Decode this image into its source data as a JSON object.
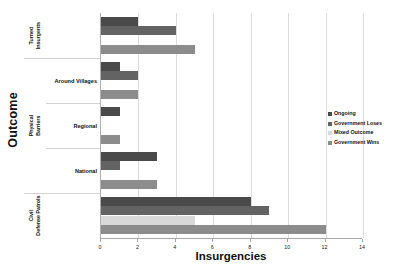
{
  "chart_data": {
    "type": "bar",
    "orientation": "horizontal",
    "title": "",
    "xlabel": "Insurgencies",
    "ylabel": "Outcome",
    "xlim": [
      0,
      14
    ],
    "xticks": [
      0,
      2,
      4,
      6,
      8,
      10,
      12,
      14
    ],
    "grid": "vertical",
    "legend_position": "right",
    "categories": [
      "Turned Insurgents",
      "Around Villages",
      "Regional",
      "National",
      "Civil Defense Patrols"
    ],
    "category_groups": [
      {
        "label": "Turned Insurgents",
        "members": [
          "Turned Insurgents"
        ]
      },
      {
        "label": "Physical Barriers",
        "members": [
          "Around Villages",
          "Regional",
          "National"
        ]
      },
      {
        "label": "Civil Defense Patrols",
        "members": [
          "Civil Defense Patrols"
        ]
      }
    ],
    "series": [
      {
        "name": "Ongoing",
        "color": "#4a4a4a",
        "values": [
          2,
          1,
          1,
          3,
          8
        ]
      },
      {
        "name": "Government Loses",
        "color": "#636363",
        "values": [
          4,
          2,
          0,
          1,
          9
        ]
      },
      {
        "name": "Mixed Outcome",
        "color": "#d9d9d9",
        "values": [
          0,
          0,
          0,
          0,
          5
        ]
      },
      {
        "name": "Government Wins",
        "color": "#8c8c8c",
        "values": [
          5,
          2,
          1,
          3,
          12
        ]
      }
    ]
  },
  "axes": {
    "y_title": "Outcome",
    "x_title": "Insurgencies",
    "x_tick_labels": [
      "0",
      "2",
      "4",
      "6",
      "8",
      "10",
      "12",
      "14"
    ]
  },
  "outer_labels": [
    {
      "label": "Turned Insurgents"
    },
    {
      "label": "Physical Barriers"
    },
    {
      "label": "Civil Defense Patrols"
    }
  ],
  "inner_labels": [
    {
      "label": "Around Villages"
    },
    {
      "label": "Regional"
    },
    {
      "label": "National"
    }
  ],
  "legend": {
    "items": [
      {
        "label": "Ongoing",
        "color": "#4a4a4a"
      },
      {
        "label": "Government Loses",
        "color": "#636363"
      },
      {
        "label": "Mixed Outcome",
        "color": "#d9d9d9"
      },
      {
        "label": "Government Wins",
        "color": "#8c8c8c"
      }
    ]
  }
}
